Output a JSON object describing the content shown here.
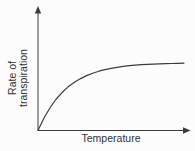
{
  "chart_data": {
    "type": "line",
    "title": "",
    "xlabel": "Temperature",
    "ylabel": "Rate of transpiration",
    "ylabel_lines": [
      "Rate of",
      "transpiration"
    ],
    "x_range": [
      0,
      1
    ],
    "y_range": [
      0,
      1
    ],
    "grid": false,
    "axis_ticks": "none",
    "axis_arrows": true,
    "legend": "none",
    "series": [
      {
        "name": "rate-of-transpiration-curve",
        "shape": "saturating-rise-to-plateau",
        "x": [
          0,
          0.04,
          0.08,
          0.12,
          0.16,
          0.2,
          0.24,
          0.28,
          0.32,
          0.36,
          0.4,
          0.44,
          0.48,
          0.52,
          0.56,
          0.6,
          0.64,
          0.68,
          0.72,
          0.76,
          0.8,
          0.84,
          0.88,
          0.92,
          0.96
        ],
        "y": [
          0,
          0.104,
          0.188,
          0.257,
          0.312,
          0.358,
          0.394,
          0.424,
          0.448,
          0.468,
          0.484,
          0.497,
          0.508,
          0.516,
          0.523,
          0.529,
          0.533,
          0.537,
          0.54,
          0.542,
          0.544,
          0.546,
          0.547,
          0.548,
          0.549
        ]
      }
    ]
  },
  "colors": {
    "line": "#3c3c3c",
    "text": "#333333",
    "background": "#fcfcfc"
  }
}
